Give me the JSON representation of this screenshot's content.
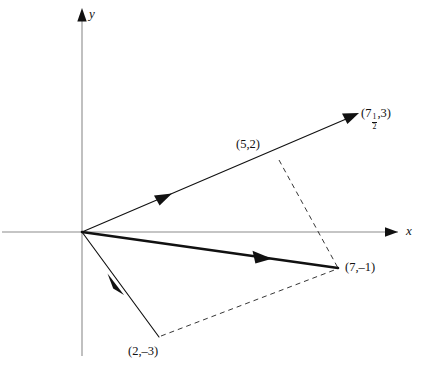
{
  "figure": {
    "type": "vector-diagram",
    "background": "#ffffff",
    "ink_color": "#111111",
    "axis_color": "#8c8c8c",
    "width": 432,
    "height": 367
  },
  "axes": {
    "x_label": "x",
    "y_label": "y",
    "origin_px": [
      82,
      232
    ],
    "x_axis_px": {
      "x1": 2,
      "y1": 232,
      "x2": 398,
      "y2": 232
    },
    "y_axis_px": {
      "x1": 82,
      "y1": 356,
      "x2": 82,
      "y2": 12
    }
  },
  "points": [
    {
      "name": "point-5-2",
      "label": "(5,2)",
      "label_parts": {
        "prefix": "(5,2)"
      },
      "coords": [
        5,
        2
      ],
      "px": [
        278,
        158
      ],
      "label_px": [
        236,
        138
      ]
    },
    {
      "name": "point-7-neg1",
      "label": "(7,–1)",
      "label_parts": {
        "prefix": "(7,–1)"
      },
      "coords": [
        7,
        -1
      ],
      "px": [
        338,
        268
      ],
      "label_px": [
        345,
        261
      ]
    },
    {
      "name": "point-2-neg3",
      "label": "(2,–3)",
      "label_parts": {
        "prefix": "(2,–3)"
      },
      "coords": [
        2,
        -3
      ],
      "px": [
        158,
        337
      ],
      "label_px": [
        128,
        345
      ]
    },
    {
      "name": "point-7half-3",
      "label": "(7½,3)",
      "label_parts": {
        "open": "(7",
        "numerator": "1",
        "denominator": "2",
        "close": ",3)"
      },
      "coords": [
        7.5,
        3
      ],
      "px": [
        358,
        114
      ],
      "label_px": [
        361,
        108
      ]
    }
  ],
  "vectors": [
    {
      "name": "vector-to-5-2-extended",
      "from": [
        0,
        0
      ],
      "to": [
        7.5,
        3
      ],
      "from_px": [
        82,
        232
      ],
      "to_px": [
        358,
        114
      ],
      "style": "thin",
      "has_tip_arrow": true,
      "mid_arrow_px": [
        168,
        196
      ],
      "description": "ray through (5,2) to (7½,3)"
    },
    {
      "name": "vector-to-2-neg3",
      "from": [
        0,
        0
      ],
      "to": [
        2,
        -3
      ],
      "from_px": [
        82,
        232
      ],
      "to_px": [
        158,
        337
      ],
      "style": "thin",
      "has_tip_arrow": false,
      "mid_arrow_px": [
        120,
        290
      ],
      "description": "vector to (2,–3)"
    },
    {
      "name": "vector-resultant-7-neg1",
      "from": [
        0,
        0
      ],
      "to": [
        7,
        -1
      ],
      "from_px": [
        82,
        232
      ],
      "to_px": [
        338,
        268
      ],
      "style": "thick",
      "has_tip_arrow": false,
      "mid_arrow_px": [
        262,
        258
      ],
      "description": "resultant vector to (7,–1)"
    }
  ],
  "dashed_lines": [
    {
      "name": "dash-5-2-to-7-neg1",
      "from_px": [
        278,
        160
      ],
      "to_px": [
        338,
        268
      ],
      "from_point": "(5,2)",
      "to_point": "(7,–1)"
    },
    {
      "name": "dash-2-neg3-to-7-neg1",
      "from_px": [
        160,
        336
      ],
      "to_px": [
        338,
        269
      ],
      "from_point": "(2,–3)",
      "to_point": "(7,–1)"
    }
  ]
}
